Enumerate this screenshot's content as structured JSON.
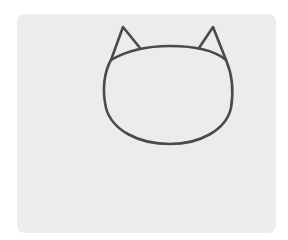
{
  "canvas": {
    "background_color": "#ffffff",
    "card_color": "#ececec",
    "stroke_color": "#4a4a4a"
  },
  "drawing": {
    "subject": "cat-head-outline",
    "parts": [
      "left-ear",
      "right-ear",
      "head"
    ]
  }
}
